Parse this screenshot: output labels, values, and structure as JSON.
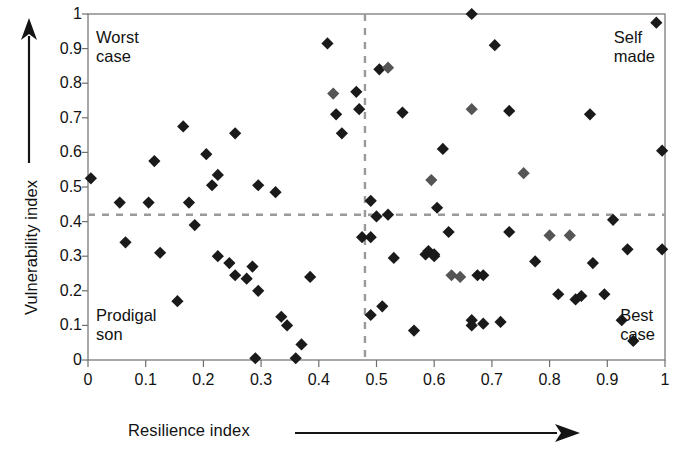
{
  "chart_data": {
    "type": "scatter",
    "title": "",
    "xlabel": "Resilience index",
    "ylabel": "Vulnerability index",
    "xlim": [
      0,
      1
    ],
    "ylim": [
      0,
      1
    ],
    "xticks": [
      "0",
      "0.1",
      "0.2",
      "0.3",
      "0.4",
      "0.5",
      "0.6",
      "0.7",
      "0.8",
      "0.9",
      "1"
    ],
    "yticks": [
      "1",
      "0.9",
      "0.8",
      "0.7",
      "0.6",
      "0.5",
      "0.4",
      "0.3",
      "0.2",
      "0.1",
      "0"
    ],
    "grid": false,
    "legend": "none",
    "marker": "diamond",
    "marker_colors": [
      "#1a1a1a",
      "#555555"
    ],
    "reference_lines": [
      {
        "name": "vertical-threshold",
        "orientation": "vertical",
        "value": 0.48,
        "style": "dashed",
        "color": "#9a9a9a"
      },
      {
        "name": "horizontal-threshold",
        "orientation": "horizontal",
        "value": 0.42,
        "style": "dashed",
        "color": "#9a9a9a"
      }
    ],
    "annotations": [
      {
        "name": "worst-case",
        "text": "Worst\ncase",
        "quadrant": "top-left"
      },
      {
        "name": "self-made",
        "text": "Self\nmade",
        "quadrant": "top-right"
      },
      {
        "name": "prodigal-son",
        "text": "Prodigal\nson",
        "quadrant": "bottom-left"
      },
      {
        "name": "best-case",
        "text": "Best\ncase",
        "quadrant": "bottom-right"
      }
    ],
    "points": [
      {
        "x": 0.005,
        "y": 0.525,
        "shade": "dark"
      },
      {
        "x": 0.055,
        "y": 0.455,
        "shade": "dark"
      },
      {
        "x": 0.065,
        "y": 0.34,
        "shade": "dark"
      },
      {
        "x": 0.105,
        "y": 0.455,
        "shade": "dark"
      },
      {
        "x": 0.115,
        "y": 0.575,
        "shade": "dark"
      },
      {
        "x": 0.125,
        "y": 0.31,
        "shade": "dark"
      },
      {
        "x": 0.155,
        "y": 0.17,
        "shade": "dark"
      },
      {
        "x": 0.165,
        "y": 0.675,
        "shade": "dark"
      },
      {
        "x": 0.175,
        "y": 0.455,
        "shade": "dark"
      },
      {
        "x": 0.185,
        "y": 0.39,
        "shade": "dark"
      },
      {
        "x": 0.205,
        "y": 0.595,
        "shade": "dark"
      },
      {
        "x": 0.215,
        "y": 0.505,
        "shade": "dark"
      },
      {
        "x": 0.225,
        "y": 0.535,
        "shade": "dark"
      },
      {
        "x": 0.225,
        "y": 0.3,
        "shade": "dark"
      },
      {
        "x": 0.245,
        "y": 0.28,
        "shade": "dark"
      },
      {
        "x": 0.255,
        "y": 0.655,
        "shade": "dark"
      },
      {
        "x": 0.255,
        "y": 0.245,
        "shade": "dark"
      },
      {
        "x": 0.275,
        "y": 0.235,
        "shade": "dark"
      },
      {
        "x": 0.285,
        "y": 0.27,
        "shade": "dark"
      },
      {
        "x": 0.295,
        "y": 0.505,
        "shade": "dark"
      },
      {
        "x": 0.295,
        "y": 0.2,
        "shade": "dark"
      },
      {
        "x": 0.29,
        "y": 0.005,
        "shade": "dark"
      },
      {
        "x": 0.325,
        "y": 0.485,
        "shade": "dark"
      },
      {
        "x": 0.335,
        "y": 0.125,
        "shade": "dark"
      },
      {
        "x": 0.345,
        "y": 0.1,
        "shade": "dark"
      },
      {
        "x": 0.36,
        "y": 0.005,
        "shade": "dark"
      },
      {
        "x": 0.37,
        "y": 0.045,
        "shade": "dark"
      },
      {
        "x": 0.385,
        "y": 0.24,
        "shade": "dark"
      },
      {
        "x": 0.415,
        "y": 0.915,
        "shade": "dark"
      },
      {
        "x": 0.425,
        "y": 0.77,
        "shade": "med"
      },
      {
        "x": 0.43,
        "y": 0.71,
        "shade": "dark"
      },
      {
        "x": 0.44,
        "y": 0.655,
        "shade": "dark"
      },
      {
        "x": 0.465,
        "y": 0.775,
        "shade": "dark"
      },
      {
        "x": 0.47,
        "y": 0.725,
        "shade": "dark"
      },
      {
        "x": 0.475,
        "y": 0.355,
        "shade": "dark"
      },
      {
        "x": 0.49,
        "y": 0.46,
        "shade": "dark"
      },
      {
        "x": 0.49,
        "y": 0.355,
        "shade": "dark"
      },
      {
        "x": 0.49,
        "y": 0.13,
        "shade": "dark"
      },
      {
        "x": 0.5,
        "y": 0.415,
        "shade": "dark"
      },
      {
        "x": 0.505,
        "y": 0.84,
        "shade": "dark"
      },
      {
        "x": 0.52,
        "y": 0.845,
        "shade": "med"
      },
      {
        "x": 0.51,
        "y": 0.155,
        "shade": "dark"
      },
      {
        "x": 0.52,
        "y": 0.42,
        "shade": "dark"
      },
      {
        "x": 0.53,
        "y": 0.295,
        "shade": "dark"
      },
      {
        "x": 0.545,
        "y": 0.715,
        "shade": "dark"
      },
      {
        "x": 0.565,
        "y": 0.085,
        "shade": "dark"
      },
      {
        "x": 0.585,
        "y": 0.305,
        "shade": "dark"
      },
      {
        "x": 0.59,
        "y": 0.315,
        "shade": "dark"
      },
      {
        "x": 0.6,
        "y": 0.305,
        "shade": "dark"
      },
      {
        "x": 0.6,
        "y": 0.3,
        "shade": "dark"
      },
      {
        "x": 0.595,
        "y": 0.52,
        "shade": "med"
      },
      {
        "x": 0.605,
        "y": 0.44,
        "shade": "dark"
      },
      {
        "x": 0.615,
        "y": 0.61,
        "shade": "dark"
      },
      {
        "x": 0.625,
        "y": 0.37,
        "shade": "dark"
      },
      {
        "x": 0.63,
        "y": 0.245,
        "shade": "med"
      },
      {
        "x": 0.645,
        "y": 0.24,
        "shade": "med"
      },
      {
        "x": 0.665,
        "y": 1.0,
        "shade": "dark"
      },
      {
        "x": 0.665,
        "y": 0.725,
        "shade": "med"
      },
      {
        "x": 0.665,
        "y": 0.115,
        "shade": "dark"
      },
      {
        "x": 0.665,
        "y": 0.1,
        "shade": "dark"
      },
      {
        "x": 0.675,
        "y": 0.245,
        "shade": "dark"
      },
      {
        "x": 0.685,
        "y": 0.245,
        "shade": "dark"
      },
      {
        "x": 0.685,
        "y": 0.105,
        "shade": "dark"
      },
      {
        "x": 0.705,
        "y": 0.91,
        "shade": "dark"
      },
      {
        "x": 0.715,
        "y": 0.11,
        "shade": "dark"
      },
      {
        "x": 0.73,
        "y": 0.72,
        "shade": "dark"
      },
      {
        "x": 0.73,
        "y": 0.37,
        "shade": "dark"
      },
      {
        "x": 0.755,
        "y": 0.54,
        "shade": "med"
      },
      {
        "x": 0.775,
        "y": 0.285,
        "shade": "dark"
      },
      {
        "x": 0.8,
        "y": 0.36,
        "shade": "med"
      },
      {
        "x": 0.815,
        "y": 0.19,
        "shade": "dark"
      },
      {
        "x": 0.835,
        "y": 0.36,
        "shade": "med"
      },
      {
        "x": 0.845,
        "y": 0.175,
        "shade": "dark"
      },
      {
        "x": 0.855,
        "y": 0.185,
        "shade": "dark"
      },
      {
        "x": 0.87,
        "y": 0.71,
        "shade": "dark"
      },
      {
        "x": 0.875,
        "y": 0.28,
        "shade": "dark"
      },
      {
        "x": 0.895,
        "y": 0.19,
        "shade": "dark"
      },
      {
        "x": 0.91,
        "y": 0.405,
        "shade": "dark"
      },
      {
        "x": 0.925,
        "y": 0.115,
        "shade": "dark"
      },
      {
        "x": 0.935,
        "y": 0.32,
        "shade": "dark"
      },
      {
        "x": 0.945,
        "y": 0.055,
        "shade": "dark"
      },
      {
        "x": 0.985,
        "y": 0.975,
        "shade": "dark"
      },
      {
        "x": 0.995,
        "y": 0.605,
        "shade": "dark"
      },
      {
        "x": 0.995,
        "y": 0.32,
        "shade": "dark"
      }
    ]
  },
  "axes": {
    "x_caption": "Resilience index",
    "y_caption": "Vulnerability index",
    "x_tick_labels": [
      "0",
      "0.1",
      "0.2",
      "0.3",
      "0.4",
      "0.5",
      "0.6",
      "0.7",
      "0.8",
      "0.9",
      "1"
    ],
    "y_tick_labels": [
      "1",
      "0.9",
      "0.8",
      "0.7",
      "0.6",
      "0.5",
      "0.4",
      "0.3",
      "0.2",
      "0.1",
      "0"
    ]
  },
  "quadrants": {
    "top_left": "Worst\ncase",
    "top_right": "Self\nmade",
    "bottom_left": "Prodigal\nson",
    "bottom_right": "Best\ncase"
  },
  "colors": {
    "marker_dark": "#1a1a1a",
    "marker_medium": "#555555",
    "axis": "#6f6f6f",
    "dashed": "#9a9a9a",
    "text": "#121212"
  }
}
